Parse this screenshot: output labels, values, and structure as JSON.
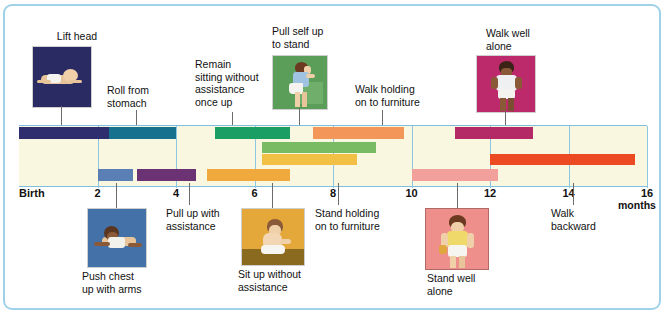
{
  "chart_data": {
    "type": "bar",
    "xlabel": "months",
    "xlim": [
      0,
      16
    ],
    "grid": true,
    "legend": "none",
    "axis_origin_label": "Birth",
    "tick_labels": [
      "Birth",
      "2",
      "4",
      "6",
      "8",
      "10",
      "12",
      "14",
      "16"
    ],
    "tick_values": [
      0,
      2,
      4,
      6,
      8,
      10,
      12,
      14,
      16
    ],
    "units_label": "months",
    "rows": 4,
    "bars": [
      {
        "label": "Lift head",
        "row": 1,
        "start": 0.0,
        "end": 2.3,
        "color": "#2e2e6e"
      },
      {
        "label": "Roll from stomach",
        "row": 1,
        "start": 2.3,
        "end": 4.0,
        "color": "#16718f"
      },
      {
        "label": "Remain sitting without assistance once up",
        "row": 1,
        "start": 5.0,
        "end": 6.9,
        "color": "#1a9e63"
      },
      {
        "label": "Pull self up to stand",
        "row": 1,
        "start": 7.5,
        "end": 9.8,
        "color": "#f2965a"
      },
      {
        "label": "Walk well alone",
        "row": 1,
        "start": 11.1,
        "end": 13.1,
        "color": "#b42a66"
      },
      {
        "label": "Walk holding on to furniture",
        "row": 2,
        "start": 6.2,
        "end": 9.1,
        "color": "#78bb63"
      },
      {
        "label": "Stand holding on to furniture",
        "row": 3,
        "start": 6.2,
        "end": 8.6,
        "color": "#f2c044"
      },
      {
        "label": "Walk backward",
        "row": 3,
        "start": 12.0,
        "end": 15.7,
        "color": "#ec4a22"
      },
      {
        "label": "Push chest up with arms",
        "row": 4,
        "start": 2.0,
        "end": 2.9,
        "color": "#5a7fb4"
      },
      {
        "label": "Pull up with assistance",
        "row": 4,
        "start": 3.0,
        "end": 4.5,
        "color": "#6b3274"
      },
      {
        "label": "Sit up without assistance",
        "row": 4,
        "start": 4.8,
        "end": 6.9,
        "color": "#f0a93c"
      },
      {
        "label": "Stand well alone",
        "row": 4,
        "start": 10.0,
        "end": 12.2,
        "color": "#f2a09c"
      }
    ]
  },
  "callouts_top": [
    {
      "name": "lift-head",
      "text": "Lift  head",
      "has_photo": true
    },
    {
      "name": "roll-from-stomach",
      "text": "Roll from\nstomach",
      "has_photo": false
    },
    {
      "name": "remain-sitting",
      "text": "Remain\nsitting without\nassistance\nonce up",
      "has_photo": false
    },
    {
      "name": "pull-self-up",
      "text": "Pull self up\nto stand",
      "has_photo": true
    },
    {
      "name": "walk-holding",
      "text": "Walk holding\non to furniture",
      "has_photo": false
    },
    {
      "name": "walk-well-alone",
      "text": "Walk well\nalone",
      "has_photo": true
    }
  ],
  "callouts_bottom": [
    {
      "name": "push-chest-up",
      "text": "Push chest\nup with arms",
      "has_photo": true
    },
    {
      "name": "pull-up-assist",
      "text": "Pull up with\nassistance",
      "has_photo": false
    },
    {
      "name": "sit-up-without",
      "text": "Sit up without\nassistance",
      "has_photo": true
    },
    {
      "name": "stand-holding",
      "text": "Stand holding\non to furniture",
      "has_photo": false
    },
    {
      "name": "stand-well-alone",
      "text": "Stand well\nalone",
      "has_photo": true
    },
    {
      "name": "walk-backward",
      "text": "Walk\nbackward",
      "has_photo": false
    }
  ],
  "photos": {
    "lift_head": {
      "bg": "#2b2b63",
      "caption_position": "above"
    },
    "pull_self_up": {
      "bg": "#5a9e5a",
      "caption_position": "above"
    },
    "walk_well_alone": {
      "bg": "#bd2a6c",
      "caption_position": "above"
    },
    "push_chest_up": {
      "bg": "#4472a8",
      "caption_position": "below"
    },
    "sit_up_without": {
      "bg": "#e3a73a",
      "ground": "#8a6a1e",
      "caption_position": "below"
    },
    "stand_well_alone": {
      "bg": "#ef8f8c",
      "caption_position": "below"
    }
  },
  "colors": {
    "frame": "#9fd2e8",
    "plot_background": "#f9f7e0",
    "gridline": "#8cc6e2",
    "leader_line": "#6b6b6b",
    "text": "#111111"
  }
}
